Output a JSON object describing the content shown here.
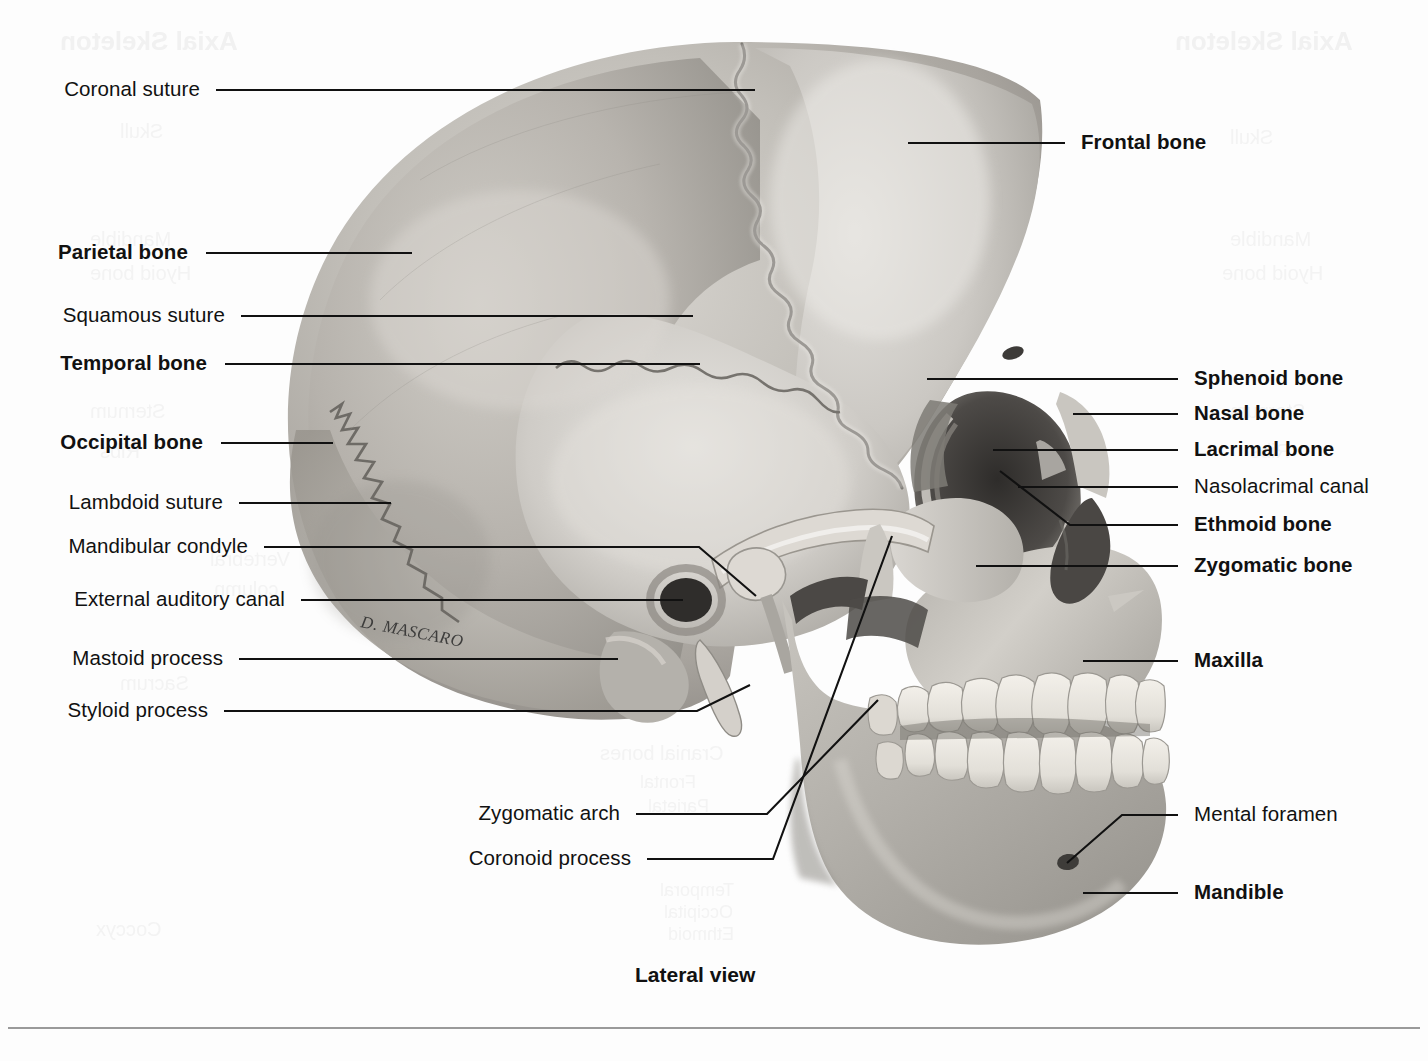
{
  "figure": {
    "caption": "Lateral view",
    "artist_signature": "D. MASCARO"
  },
  "background_ghost_text": [
    {
      "text": "Axial Skeleton",
      "x": 60,
      "y": 26,
      "size": 26,
      "bold": true
    },
    {
      "text": "Skull",
      "x": 120,
      "y": 120,
      "size": 20,
      "bold": false
    },
    {
      "text": "Mandible",
      "x": 90,
      "y": 228,
      "size": 20,
      "bold": false
    },
    {
      "text": "Hyoid bone",
      "x": 90,
      "y": 262,
      "size": 20,
      "bold": false
    },
    {
      "text": "Sternum",
      "x": 90,
      "y": 400,
      "size": 20,
      "bold": false
    },
    {
      "text": "Ribs",
      "x": 100,
      "y": 440,
      "size": 20,
      "bold": false
    },
    {
      "text": "Vertebral",
      "x": 210,
      "y": 548,
      "size": 20,
      "bold": false
    },
    {
      "text": "column",
      "x": 214,
      "y": 578,
      "size": 20,
      "bold": false
    },
    {
      "text": "Sacrum",
      "x": 120,
      "y": 672,
      "size": 20,
      "bold": false
    },
    {
      "text": "Coccyx",
      "x": 96,
      "y": 918,
      "size": 20,
      "bold": false
    },
    {
      "text": "Axial Skeleton",
      "x": 1175,
      "y": 26,
      "size": 26,
      "bold": true
    },
    {
      "text": "Skull",
      "x": 1230,
      "y": 126,
      "size": 20,
      "bold": false
    },
    {
      "text": "Mandible",
      "x": 1230,
      "y": 228,
      "size": 20,
      "bold": false
    },
    {
      "text": "Hyoid bone",
      "x": 1222,
      "y": 262,
      "size": 20,
      "bold": false
    },
    {
      "text": "Sternum",
      "x": 1230,
      "y": 400,
      "size": 20,
      "bold": false
    },
    {
      "text": "Ribs",
      "x": 1250,
      "y": 440,
      "size": 20,
      "bold": false
    },
    {
      "text": "Cranial bones",
      "x": 600,
      "y": 742,
      "size": 20,
      "bold": false
    },
    {
      "text": "Frontal",
      "x": 640,
      "y": 772,
      "size": 18,
      "bold": false
    },
    {
      "text": "Parietal",
      "x": 648,
      "y": 796,
      "size": 18,
      "bold": false
    },
    {
      "text": "Temporal",
      "x": 660,
      "y": 880,
      "size": 18,
      "bold": false
    },
    {
      "text": "Occipital",
      "x": 664,
      "y": 902,
      "size": 18,
      "bold": false
    },
    {
      "text": "Ethmoid",
      "x": 668,
      "y": 924,
      "size": 18,
      "bold": false
    }
  ],
  "labels_left": [
    {
      "id": "coronal-suture",
      "text": "Coronal suture",
      "bold": false,
      "x_right": 200,
      "y": 90
    },
    {
      "id": "parietal-bone",
      "text": "Parietal bone",
      "bold": true,
      "x_right": 188,
      "y": 253
    },
    {
      "id": "squamous-suture",
      "text": "Squamous suture",
      "bold": false,
      "x_right": 225,
      "y": 316
    },
    {
      "id": "temporal-bone",
      "text": "Temporal bone",
      "bold": true,
      "x_right": 207,
      "y": 364
    },
    {
      "id": "occipital-bone",
      "text": "Occipital bone",
      "bold": true,
      "x_right": 203,
      "y": 443
    },
    {
      "id": "lambdoid-suture",
      "text": "Lambdoid suture",
      "bold": false,
      "x_right": 223,
      "y": 503
    },
    {
      "id": "mandibular-condyle",
      "text": "Mandibular condyle",
      "bold": false,
      "x_right": 248,
      "y": 547
    },
    {
      "id": "external-auditory-canal",
      "text": "External auditory canal",
      "bold": false,
      "x_right": 285,
      "y": 600
    },
    {
      "id": "mastoid-process",
      "text": "Mastoid process",
      "bold": false,
      "x_right": 223,
      "y": 659
    },
    {
      "id": "styloid-process",
      "text": "Styloid process",
      "bold": false,
      "x_right": 208,
      "y": 711
    },
    {
      "id": "zygomatic-arch",
      "text": "Zygomatic arch",
      "bold": false,
      "x_right": 620,
      "y": 814
    },
    {
      "id": "coronoid-process",
      "text": "Coronoid process",
      "bold": false,
      "x_right": 631,
      "y": 859
    }
  ],
  "labels_right": [
    {
      "id": "frontal-bone",
      "text": "Frontal bone",
      "bold": true,
      "x_left": 1081,
      "y": 143
    },
    {
      "id": "sphenoid-bone",
      "text": "Sphenoid bone",
      "bold": true,
      "x_left": 1194,
      "y": 379
    },
    {
      "id": "nasal-bone",
      "text": "Nasal bone",
      "bold": true,
      "x_left": 1194,
      "y": 414
    },
    {
      "id": "lacrimal-bone",
      "text": "Lacrimal bone",
      "bold": true,
      "x_left": 1194,
      "y": 450
    },
    {
      "id": "nasolacrimal-canal",
      "text": "Nasolacrimal canal",
      "bold": false,
      "x_left": 1194,
      "y": 487
    },
    {
      "id": "ethmoid-bone",
      "text": "Ethmoid bone",
      "bold": true,
      "x_left": 1194,
      "y": 525
    },
    {
      "id": "zygomatic-bone",
      "text": "Zygomatic bone",
      "bold": true,
      "x_left": 1194,
      "y": 566
    },
    {
      "id": "maxilla",
      "text": "Maxilla",
      "bold": true,
      "x_left": 1194,
      "y": 661
    },
    {
      "id": "mental-foramen",
      "text": "Mental foramen",
      "bold": false,
      "x_left": 1194,
      "y": 815
    },
    {
      "id": "mandible",
      "text": "Mandible",
      "bold": true,
      "x_left": 1194,
      "y": 893
    }
  ],
  "leaders": [
    {
      "for": "coronal-suture",
      "points": "216,90 755,90"
    },
    {
      "for": "parietal-bone",
      "points": "206,253 412,253"
    },
    {
      "for": "squamous-suture",
      "points": "241,316 693,316"
    },
    {
      "for": "temporal-bone",
      "points": "225,364 700,364"
    },
    {
      "for": "occipital-bone",
      "points": "221,443 333,443"
    },
    {
      "for": "lambdoid-suture",
      "points": "239,503 391,503"
    },
    {
      "for": "mandibular-condyle",
      "points": "264,547 699,547 756,596"
    },
    {
      "for": "external-auditory-canal",
      "points": "301,600 683,600"
    },
    {
      "for": "mastoid-process",
      "points": "239,659 618,659"
    },
    {
      "for": "styloid-process",
      "points": "224,711 697,711 750,685"
    },
    {
      "for": "zygomatic-arch",
      "points": "636,814 767,814 878,700"
    },
    {
      "for": "coronoid-process",
      "points": "647,859 773,859 892,536"
    },
    {
      "for": "frontal-bone",
      "points": "1065,143 908,143"
    },
    {
      "for": "sphenoid-bone",
      "points": "1178,379 927,379"
    },
    {
      "for": "nasal-bone",
      "points": "1178,414 1073,414"
    },
    {
      "for": "lacrimal-bone",
      "points": "1178,450 993,450"
    },
    {
      "for": "nasolacrimal-canal",
      "points": "1178,487 1018,487"
    },
    {
      "for": "ethmoid-bone",
      "points": "1178,525 1070,525 1000,471"
    },
    {
      "for": "zygomatic-bone",
      "points": "1178,566 976,566"
    },
    {
      "for": "maxilla",
      "points": "1178,661 1083,661"
    },
    {
      "for": "mental-foramen",
      "points": "1178,815 1122,815 1067,863"
    },
    {
      "for": "mandible",
      "points": "1178,893 1083,893"
    }
  ],
  "colors": {
    "ink": "#111111",
    "page": "#fdfdfd",
    "rule": "#9a9a9a",
    "bone_light": "#e9e7e3",
    "bone_mid": "#bfbcb6",
    "bone_dark": "#8e8b85",
    "bone_shadow": "#5e5b57",
    "cavity": "#3a3836",
    "tooth": "#efece6"
  }
}
